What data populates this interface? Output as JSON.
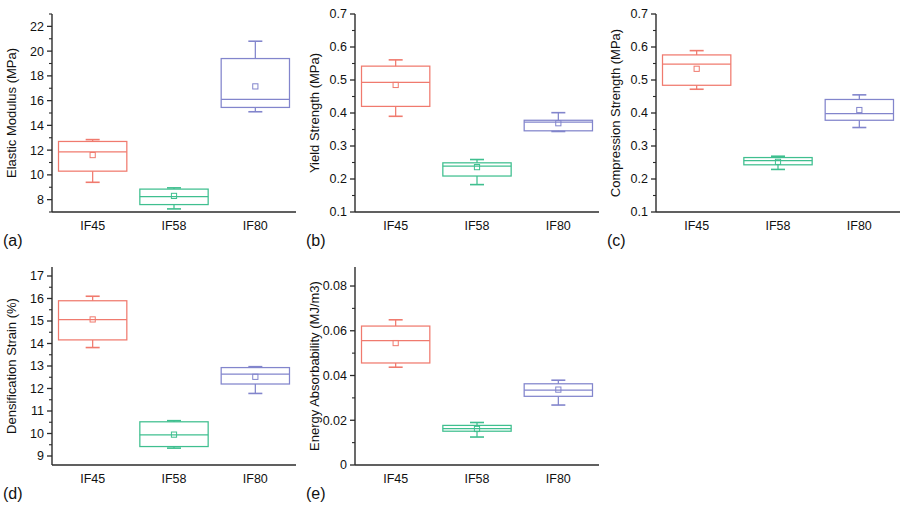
{
  "figure": {
    "panel_letters": [
      "(a)",
      "(b)",
      "(c)",
      "(d)",
      "(e)"
    ],
    "categories": [
      "IF45",
      "IF58",
      "IF80"
    ],
    "colors": {
      "IF45": "#F07A6E",
      "IF58": "#3FBF8F",
      "IF80": "#8285CC",
      "axis": "#2b2b2b",
      "text": "#111111",
      "background": "#ffffff"
    }
  },
  "chart_data": [
    {
      "type": "box",
      "panel": "(a)",
      "title": "",
      "xlabel": "",
      "ylabel": "Elastic Modulus (MPa)",
      "categories": [
        "IF45",
        "IF58",
        "IF80"
      ],
      "ylim": [
        7.0,
        23.0
      ],
      "yticks": [
        8,
        10,
        12,
        14,
        16,
        18,
        20,
        22
      ],
      "ytick_labels": [
        "8",
        "10",
        "12",
        "14",
        "16",
        "18",
        "20",
        "22"
      ],
      "minor_ticks": true,
      "grid": false,
      "boxes": [
        {
          "category": "IF45",
          "color": "#F07A6E",
          "whisker_low": 9.4,
          "q1": 10.3,
          "median": 11.85,
          "q3": 12.7,
          "whisker_high": 12.85,
          "mean": 11.6
        },
        {
          "category": "IF58",
          "color": "#3FBF8F",
          "whisker_low": 7.25,
          "q1": 7.6,
          "median": 8.25,
          "q3": 8.85,
          "whisker_high": 8.95,
          "mean": 8.3
        },
        {
          "category": "IF80",
          "color": "#8285CC",
          "whisker_low": 15.1,
          "q1": 15.45,
          "median": 16.1,
          "q3": 19.4,
          "whisker_high": 20.8,
          "mean": 17.15
        }
      ]
    },
    {
      "type": "box",
      "panel": "(b)",
      "title": "",
      "xlabel": "",
      "ylabel": "Yield Strength (MPa)",
      "categories": [
        "IF45",
        "IF58",
        "IF80"
      ],
      "ylim": [
        0.1,
        0.7
      ],
      "yticks": [
        0.1,
        0.2,
        0.3,
        0.4,
        0.5,
        0.6,
        0.7
      ],
      "ytick_labels": [
        "0.1",
        "0.2",
        "0.3",
        "0.4",
        "0.5",
        "0.6",
        "0.7"
      ],
      "minor_ticks": true,
      "grid": false,
      "boxes": [
        {
          "category": "IF45",
          "color": "#F07A6E",
          "whisker_low": 0.39,
          "q1": 0.42,
          "median": 0.493,
          "q3": 0.542,
          "whisker_high": 0.561,
          "mean": 0.485
        },
        {
          "category": "IF58",
          "color": "#3FBF8F",
          "whisker_low": 0.183,
          "q1": 0.209,
          "median": 0.239,
          "q3": 0.249,
          "whisker_high": 0.259,
          "mean": 0.236
        },
        {
          "category": "IF80",
          "color": "#8285CC",
          "whisker_low": 0.344,
          "q1": 0.346,
          "median": 0.372,
          "q3": 0.378,
          "whisker_high": 0.401,
          "mean": 0.369
        }
      ]
    },
    {
      "type": "box",
      "panel": "(c)",
      "title": "",
      "xlabel": "",
      "ylabel": "Compression Strength (MPa)",
      "categories": [
        "IF45",
        "IF58",
        "IF80"
      ],
      "ylim": [
        0.1,
        0.7
      ],
      "yticks": [
        0.1,
        0.2,
        0.3,
        0.4,
        0.5,
        0.6,
        0.7
      ],
      "ytick_labels": [
        "0.1",
        "0.2",
        "0.3",
        "0.4",
        "0.5",
        "0.6",
        "0.7"
      ],
      "minor_ticks": true,
      "grid": false,
      "boxes": [
        {
          "category": "IF45",
          "color": "#F07A6E",
          "whisker_low": 0.472,
          "q1": 0.484,
          "median": 0.548,
          "q3": 0.576,
          "whisker_high": 0.589,
          "mean": 0.534
        },
        {
          "category": "IF58",
          "color": "#3FBF8F",
          "whisker_low": 0.229,
          "q1": 0.243,
          "median": 0.256,
          "q3": 0.265,
          "whisker_high": 0.269,
          "mean": 0.252
        },
        {
          "category": "IF80",
          "color": "#8285CC",
          "whisker_low": 0.356,
          "q1": 0.378,
          "median": 0.398,
          "q3": 0.441,
          "whisker_high": 0.455,
          "mean": 0.409
        }
      ]
    },
    {
      "type": "box",
      "panel": "(d)",
      "title": "",
      "xlabel": "",
      "ylabel": "Densification Strain (%)",
      "categories": [
        "IF45",
        "IF58",
        "IF80"
      ],
      "ylim": [
        8.6,
        17.4
      ],
      "yticks": [
        9,
        10,
        11,
        12,
        13,
        14,
        15,
        16,
        17
      ],
      "ytick_labels": [
        "9",
        "10",
        "11",
        "12",
        "13",
        "14",
        "15",
        "16",
        "17"
      ],
      "minor_ticks": true,
      "grid": false,
      "boxes": [
        {
          "category": "IF45",
          "color": "#F07A6E",
          "whisker_low": 13.82,
          "q1": 14.16,
          "median": 15.06,
          "q3": 15.9,
          "whisker_high": 16.1,
          "mean": 15.07
        },
        {
          "category": "IF58",
          "color": "#3FBF8F",
          "whisker_low": 9.35,
          "q1": 9.42,
          "median": 9.94,
          "q3": 10.52,
          "whisker_high": 10.57,
          "mean": 9.95
        },
        {
          "category": "IF80",
          "color": "#8285CC",
          "whisker_low": 11.78,
          "q1": 12.2,
          "median": 12.64,
          "q3": 12.93,
          "whisker_high": 12.97,
          "mean": 12.52
        }
      ]
    },
    {
      "type": "box",
      "panel": "(e)",
      "title": "",
      "xlabel": "",
      "ylabel": "Energy Absorbability (MJ/m3)",
      "categories": [
        "IF45",
        "IF58",
        "IF80"
      ],
      "ylim": [
        0.0,
        0.0885
      ],
      "yticks": [
        0,
        0.02,
        0.04,
        0.06,
        0.08
      ],
      "ytick_labels": [
        "0",
        "0.02",
        "0.04",
        "0.06",
        "0.08"
      ],
      "minor_ticks": true,
      "grid": false,
      "boxes": [
        {
          "category": "IF45",
          "color": "#F07A6E",
          "whisker_low": 0.0437,
          "q1": 0.0456,
          "median": 0.0556,
          "q3": 0.0621,
          "whisker_high": 0.0649,
          "mean": 0.0545
        },
        {
          "category": "IF58",
          "color": "#3FBF8F",
          "whisker_low": 0.0125,
          "q1": 0.0151,
          "median": 0.0163,
          "q3": 0.0177,
          "whisker_high": 0.019,
          "mean": 0.0161
        },
        {
          "category": "IF80",
          "color": "#8285CC",
          "whisker_low": 0.0268,
          "q1": 0.0307,
          "median": 0.0335,
          "q3": 0.0363,
          "whisker_high": 0.0379,
          "mean": 0.0337
        }
      ]
    }
  ]
}
